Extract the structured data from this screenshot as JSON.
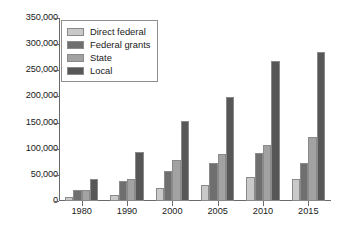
{
  "chart_data": {
    "type": "bar",
    "title": "",
    "subtitle": "",
    "xlabel": "",
    "ylabel": "",
    "categories": [
      "1980",
      "1990",
      "2000",
      "2005",
      "2010",
      "2015"
    ],
    "series": [
      {
        "name": "Direct federal",
        "color": "#c9c9c9",
        "values": [
          7000,
          12000,
          24000,
          30000,
          46000,
          42000
        ]
      },
      {
        "name": "Federal grants",
        "color": "#6f6f6f",
        "values": [
          22000,
          38000,
          58000,
          72000,
          92000,
          72000
        ]
      },
      {
        "name": "State",
        "color": "#a2a2a2",
        "values": [
          22000,
          42000,
          78000,
          90000,
          108000,
          122000
        ]
      },
      {
        "name": "Local",
        "color": "#575757",
        "values": [
          42000,
          94000,
          153000,
          198000,
          268000,
          285000
        ]
      }
    ],
    "ylim": [
      0,
      350000
    ],
    "yticks": [
      0,
      50000,
      100000,
      150000,
      200000,
      250000,
      300000,
      350000
    ],
    "ytick_labels": [
      "0",
      "50,000",
      "100,000",
      "150,000",
      "200,000",
      "250,000",
      "300,000",
      "350,000"
    ],
    "grid": false,
    "legend_position": "upper-left",
    "legend_entries": [
      "Direct federal",
      "Federal grants",
      "State",
      "Local"
    ]
  }
}
